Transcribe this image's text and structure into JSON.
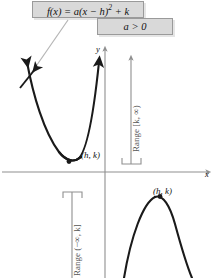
{
  "figure": {
    "callouts": {
      "formula": "f(x) = a(x − h)² + k",
      "formula_parts": {
        "fn": "f(x)",
        "eq": "=",
        "lead": "a(x − h)",
        "exponent": "2",
        "tail": "+ k"
      },
      "sign_condition": "a > 0"
    },
    "panels": [
      {
        "name": "upward-parabola",
        "opens": "up",
        "vertex_label": "(h, k)",
        "range_label": "Range [k, ∞)",
        "range_interval": "[k, ∞)",
        "direction": "up",
        "axis_x_label": "x",
        "axis_y_label": "y"
      },
      {
        "name": "downward-parabola",
        "opens": "down",
        "vertex_label": "(h, k)",
        "range_label": "Range (−∞, k]",
        "range_interval": "(−∞, k]",
        "direction": "down",
        "axis_x_label": "x",
        "axis_y_label": "y"
      }
    ],
    "colors": {
      "curve": "#1a1a1a",
      "axis": "#8f8f8f",
      "callout_fill": "#d9d9d9",
      "callout_border": "#9a9a9a",
      "range_marker": "#8f8f8f",
      "background": "#ffffff",
      "text": "#111111"
    }
  }
}
